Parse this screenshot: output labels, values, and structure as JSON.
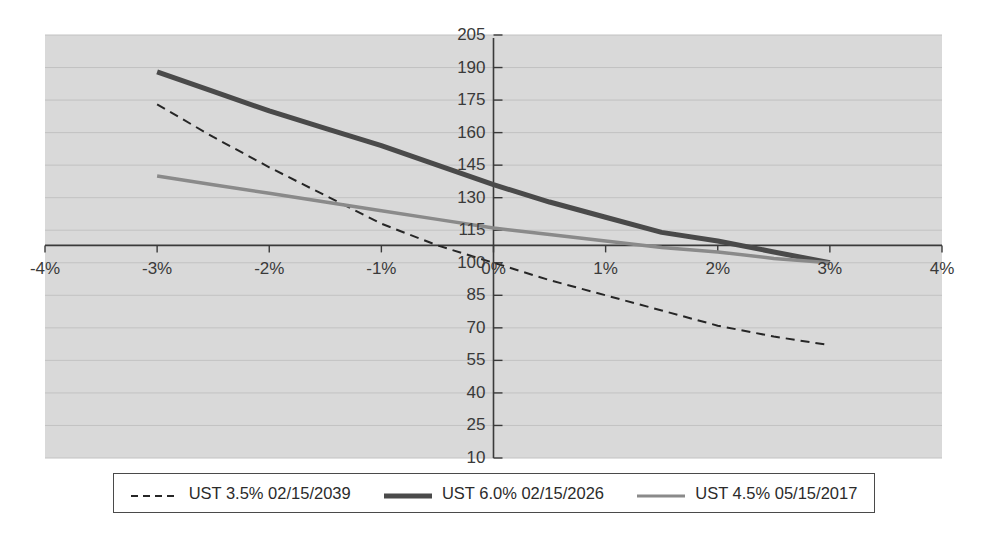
{
  "chart_data": {
    "type": "line",
    "title": "",
    "subtitle": "",
    "xlabel": "",
    "ylabel": "",
    "xlim": [
      -4,
      4
    ],
    "ylim": [
      10,
      205
    ],
    "x_tick_labels": [
      "-4%",
      "-3%",
      "-2%",
      "-1%",
      "0%",
      "1%",
      "2%",
      "3%",
      "4%"
    ],
    "x_tick_values": [
      -4,
      -3,
      -2,
      -1,
      0,
      1,
      2,
      3,
      4
    ],
    "y_tick_labels": [
      "205",
      "190",
      "175",
      "160",
      "145",
      "130",
      "115",
      "100",
      "85",
      "70",
      "55",
      "40",
      "25",
      "10"
    ],
    "y_tick_values": [
      205,
      190,
      175,
      160,
      145,
      130,
      115,
      100,
      85,
      70,
      55,
      40,
      25,
      10
    ],
    "grid": true,
    "grid_axis": "y",
    "legend_position": "bottom",
    "zero_axis_value": 108,
    "x": [
      -3,
      -2.5,
      -2,
      -1.5,
      -1,
      -0.5,
      0,
      0.5,
      1,
      1.5,
      2,
      2.5,
      3
    ],
    "series": [
      {
        "name": "UST 3.5% 02/15/2039",
        "style": "dashed",
        "color": "#262626",
        "width": 2,
        "values": [
          173,
          158,
          144,
          131,
          118,
          108,
          100,
          92,
          85,
          78,
          71,
          66,
          62
        ]
      },
      {
        "name": "UST 6.0% 02/15/2026",
        "style": "solid",
        "color": "#4a4a4a",
        "width": 5,
        "values": [
          188,
          179,
          170,
          162,
          154,
          145,
          136,
          128,
          121,
          114,
          110,
          105,
          100
        ]
      },
      {
        "name": "UST 4.5% 05/15/2017",
        "style": "solid",
        "color": "#8a8a8a",
        "width": 3.5,
        "values": [
          140,
          136,
          132,
          128,
          124,
          120,
          116,
          113,
          110,
          107,
          105,
          102,
          100
        ]
      }
    ]
  },
  "legend": {
    "entries": [
      {
        "label": "UST 3.5% 02/15/2039",
        "marker": "dashed-line-swatch"
      },
      {
        "label": "UST 6.0% 02/15/2026",
        "marker": "thick-solid-line-swatch"
      },
      {
        "label": "UST 4.5% 05/15/2017",
        "marker": "thin-solid-line-swatch"
      }
    ]
  },
  "colors": {
    "plot_background": "#d9d9d9",
    "page_background": "#ffffff",
    "axis": "#3a3a3a",
    "gridline": "#c2c2c2",
    "series_1": "#262626",
    "series_2": "#4a4a4a",
    "series_3": "#8a8a8a"
  }
}
